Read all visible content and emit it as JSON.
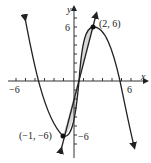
{
  "axes": {
    "x_label": "x",
    "y_label": "y",
    "x_tick_left": "−6",
    "x_tick_right": "6",
    "y_tick_top": "6",
    "y_tick_bottom": "−6"
  },
  "points": [
    {
      "label": "(2, 6)",
      "x": 2,
      "y": 6
    },
    {
      "label": "(−1, −6)",
      "x": -1,
      "y": -6
    }
  ],
  "colors": {
    "curve": "#222222",
    "shade": "#d8d8d8",
    "axis": "#333333"
  }
}
